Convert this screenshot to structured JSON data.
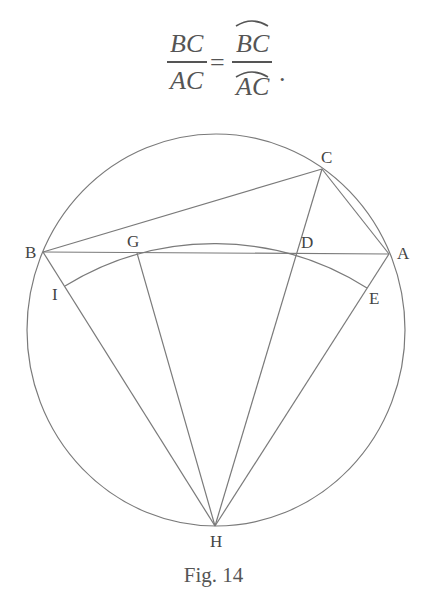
{
  "formula": {
    "left_numerator": "BC",
    "left_denominator": "AC",
    "equals": "=",
    "right_numerator": "BC",
    "right_denominator": "AC",
    "right_numerator_has_arc": true,
    "right_denominator_has_arc": true,
    "terminator": "."
  },
  "figure": {
    "caption": "Fig. 14",
    "colors": {
      "line": "#7a7a7a",
      "label": "#444444"
    },
    "circle": {
      "cx": 216,
      "cy": 330,
      "rx": 189,
      "ry": 196
    },
    "arc_IE": {
      "center": "H",
      "radius": 285,
      "from": "I",
      "to": "E",
      "through": [
        "G",
        "D"
      ]
    },
    "points": {
      "A": {
        "label": "A",
        "x": 389,
        "y": 254
      },
      "B": {
        "label": "B",
        "x": 43,
        "y": 252
      },
      "C": {
        "label": "C",
        "x": 322,
        "y": 169
      },
      "D": {
        "label": "D",
        "x": 297,
        "y": 253
      },
      "E": {
        "label": "E",
        "x": 367,
        "y": 288
      },
      "G": {
        "label": "G",
        "x": 137,
        "y": 253
      },
      "H": {
        "label": "H",
        "x": 215,
        "y": 526
      },
      "I": {
        "label": "I",
        "x": 65,
        "y": 286
      }
    },
    "segments": [
      [
        "B",
        "C"
      ],
      [
        "C",
        "A"
      ],
      [
        "B",
        "A"
      ],
      [
        "B",
        "H"
      ],
      [
        "G",
        "H"
      ],
      [
        "C",
        "H"
      ],
      [
        "A",
        "H"
      ]
    ]
  }
}
